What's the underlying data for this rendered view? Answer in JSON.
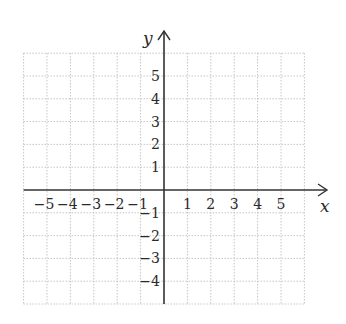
{
  "chart_data": {
    "type": "scatter",
    "title": "",
    "xlabel": "x",
    "ylabel": "y",
    "xlim": [
      -6,
      6
    ],
    "ylim": [
      -5,
      6
    ],
    "grid": true,
    "grid_style": "dotted",
    "x_ticks": [
      -5,
      -4,
      -3,
      -2,
      -1,
      1,
      2,
      3,
      4,
      5
    ],
    "y_ticks": [
      5,
      4,
      3,
      2,
      1,
      -1,
      -2,
      -3,
      -4
    ],
    "x_tick_labels": [
      "−5",
      "−4",
      "−3",
      "−2",
      "−1",
      "1",
      "2",
      "3",
      "4",
      "5"
    ],
    "y_tick_labels": [
      "5",
      "4",
      "3",
      "2",
      "1",
      "−1",
      "−2",
      "−3",
      "−4"
    ],
    "series": [],
    "legend": null
  },
  "style": {
    "axis_color": "#333333",
    "grid_color": "#b8b8b8",
    "text_color": "#2a2a2a"
  }
}
